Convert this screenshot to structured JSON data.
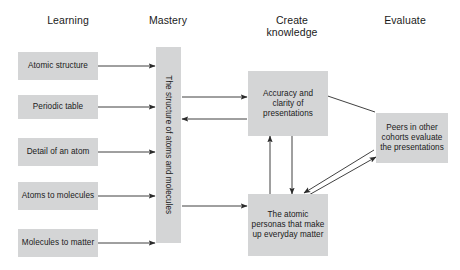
{
  "figure": {
    "background": "#ffffff",
    "node_fill": "#d4d5d6",
    "line_color": "#2b2b2b",
    "text_color": "#1a1a1a"
  },
  "columns": [
    {
      "label": "Learning"
    },
    {
      "label": "Mastery"
    },
    {
      "label": "Create\nknowledge"
    },
    {
      "label": "Evaluate"
    }
  ],
  "column_headers": {
    "learning": "Learning",
    "mastery": "Mastery",
    "create_knowledge_line1": "Create",
    "create_knowledge_line2": "knowledge",
    "evaluate": "Evaluate"
  },
  "nodes": {
    "atomic_structure": "Atomic structure",
    "periodic_table": "Periodic table",
    "detail_of_an_atom": "Detail of an atom",
    "atoms_to_molecules": "Atoms to molecules",
    "molecules_to_matter": "Molecules to matter",
    "mastery_bar": "The structure of atoms and molecules",
    "accuracy_clarity": "Accuracy and clarity of presentations",
    "atomic_personas": "The atomic personas that make up everyday matter",
    "peers_cohorts": "Peers in other cohorts evaluate the presentations"
  },
  "edges": [
    {
      "name": "atomic-structure-to-mastery",
      "from": "atomic_structure",
      "to": "mastery_bar",
      "direction": "one-way"
    },
    {
      "name": "periodic-table-to-mastery",
      "from": "periodic_table",
      "to": "mastery_bar",
      "direction": "one-way"
    },
    {
      "name": "detail-atom-to-mastery",
      "from": "detail_of_an_atom",
      "to": "mastery_bar",
      "direction": "one-way"
    },
    {
      "name": "atoms-molecules-to-mastery",
      "from": "atoms_to_molecules",
      "to": "mastery_bar",
      "direction": "one-way"
    },
    {
      "name": "molecules-matter-to-mastery",
      "from": "molecules_to_matter",
      "to": "mastery_bar",
      "direction": "one-way"
    },
    {
      "name": "mastery-to-accuracy",
      "from": "mastery_bar",
      "to": "accuracy_clarity",
      "direction": "one-way"
    },
    {
      "name": "accuracy-to-mastery",
      "from": "accuracy_clarity",
      "to": "mastery_bar",
      "direction": "one-way"
    },
    {
      "name": "mastery-to-atomic-personas",
      "from": "mastery_bar",
      "to": "atomic_personas",
      "direction": "one-way"
    },
    {
      "name": "atomic-personas-to-accuracy",
      "from": "atomic_personas",
      "to": "accuracy_clarity",
      "direction": "one-way"
    },
    {
      "name": "accuracy-to-atomic-personas",
      "from": "accuracy_clarity",
      "to": "atomic_personas",
      "direction": "one-way"
    },
    {
      "name": "peers-to-accuracy",
      "from": "peers_cohorts",
      "to": "accuracy_clarity",
      "direction": "one-way"
    },
    {
      "name": "peers-to-atomic-personas",
      "from": "peers_cohorts",
      "to": "atomic_personas",
      "direction": "one-way"
    },
    {
      "name": "atomic-personas-to-peers",
      "from": "atomic_personas",
      "to": "peers_cohorts",
      "direction": "one-way"
    }
  ]
}
